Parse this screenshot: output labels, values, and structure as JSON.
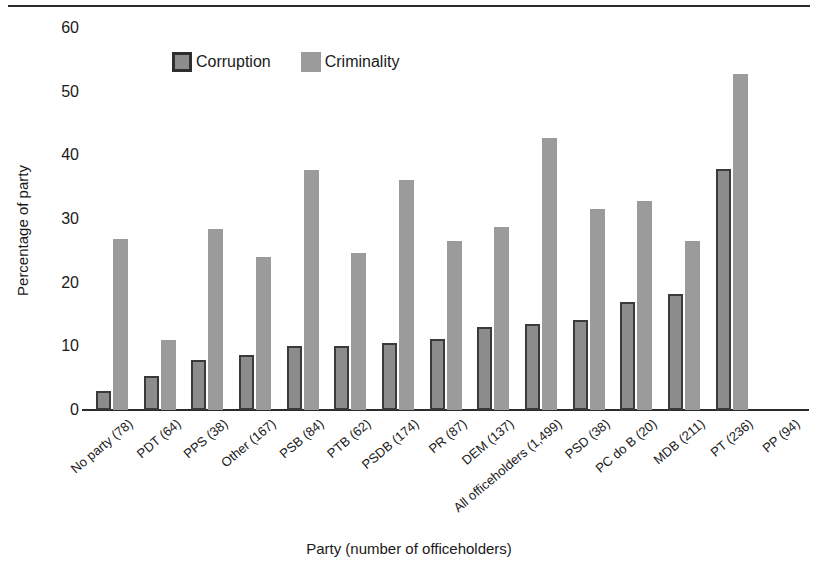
{
  "chart_data": {
    "type": "bar",
    "title": "",
    "xlabel": "Party (number of officeholders)",
    "ylabel": "Percentage of party",
    "ylim": [
      0,
      60
    ],
    "yticks": [
      0,
      10,
      20,
      30,
      40,
      50,
      60
    ],
    "grid": false,
    "legend_position": "top-center-inside",
    "categories": [
      "No party (78)",
      "PDT (64)",
      "PPS (38)",
      "Other (167)",
      "PSB (84)",
      "PTB (62)",
      "PSDB (174)",
      "PR (87)",
      "DEM (137)",
      "All officeholders (1,499)",
      "PSD (38)",
      "PC do B (20)",
      "MDB (211)",
      "PT (236)",
      "PP (94)"
    ],
    "series": [
      {
        "name": "Corruption",
        "color": "#8c8c8c",
        "edge_color": "#3a3a3a",
        "values": [
          3.0,
          5.4,
          7.9,
          8.6,
          10.0,
          10.0,
          10.6,
          11.2,
          13.1,
          13.5,
          14.2,
          17.0,
          18.3,
          37.8,
          0
        ]
      },
      {
        "name": "Criminality",
        "color": "#9b9b9b",
        "edge_color": "#9b9b9b",
        "values": [
          26.8,
          11.0,
          28.4,
          24.1,
          37.7,
          24.6,
          36.1,
          26.6,
          28.8,
          42.7,
          31.5,
          32.8,
          26.5,
          52.8,
          0
        ]
      }
    ],
    "series_aligned_note": "",
    "points": [
      {
        "category": "No party (78)",
        "corruption": 3.0,
        "criminality": 26.8
      },
      {
        "category": "PDT (64)",
        "corruption": 5.4,
        "criminality": 11.0
      },
      {
        "category": "PPS (38)",
        "corruption": 7.9,
        "criminality": 28.4
      },
      {
        "category": "Other (167)",
        "corruption": 8.6,
        "criminality": 24.1
      },
      {
        "category": "PSB (84)",
        "corruption": 10.0,
        "criminality": 37.7
      },
      {
        "category": "PTB (62)",
        "corruption": 10.0,
        "criminality": 24.6
      },
      {
        "category": "PSDB (174)",
        "corruption": 10.6,
        "criminality": 36.1
      },
      {
        "category": "PR (87)",
        "corruption": 11.2,
        "criminality": 26.6
      },
      {
        "category": "DEM (137)",
        "corruption": 13.1,
        "criminality": 28.8
      },
      {
        "category": "All officeholders (1,499)",
        "corruption": 13.5,
        "criminality": 42.7
      },
      {
        "category": "PSD (38)",
        "corruption": 14.2,
        "criminality": 31.5
      },
      {
        "category": "PC do B (20)",
        "corruption": 17.0,
        "criminality": 32.8
      },
      {
        "category": "MDB (211)",
        "corruption": 18.3,
        "criminality": 26.5
      },
      {
        "category": "PT (236)",
        "corruption": 37.8,
        "criminality": 52.8
      },
      {
        "category": "PP (94)",
        "corruption": 0,
        "criminality": 0
      }
    ],
    "legend": [
      "Corruption",
      "Criminality"
    ]
  },
  "legend": {
    "corruption_label": "Corruption",
    "criminality_label": "Criminality"
  },
  "axes": {
    "y_title": "Percentage of party",
    "x_title": "Party (number of officeholders)"
  }
}
